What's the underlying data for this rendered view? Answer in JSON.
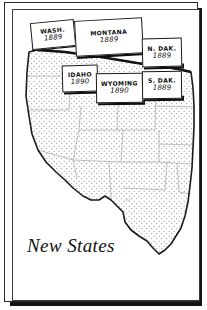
{
  "figure": {
    "title": "New States",
    "frame_color": "#2a2a2a",
    "ink_color": "#111111",
    "paper_color": "#ffffff",
    "shadow_color": "#151515"
  },
  "map": {
    "region_label": "western United States",
    "base_fill_pattern": "stipple-dots",
    "stipple_color": "#7a7a7a",
    "state_line_color": "#9a9a9a",
    "coast_outline_color": "#1a1a1a"
  },
  "callouts": [
    {
      "id": "wash",
      "name": "WASH.",
      "year": "1889"
    },
    {
      "id": "montana",
      "name": "MONTANA",
      "year": "1889"
    },
    {
      "id": "ndak",
      "name": "N. DAK.",
      "year": "1889"
    },
    {
      "id": "idaho",
      "name": "IDAHO",
      "year": "1890"
    },
    {
      "id": "wyoming",
      "name": "WYOMING",
      "year": "1890"
    },
    {
      "id": "sdak",
      "name": "S. DAK.",
      "year": "1889"
    }
  ]
}
